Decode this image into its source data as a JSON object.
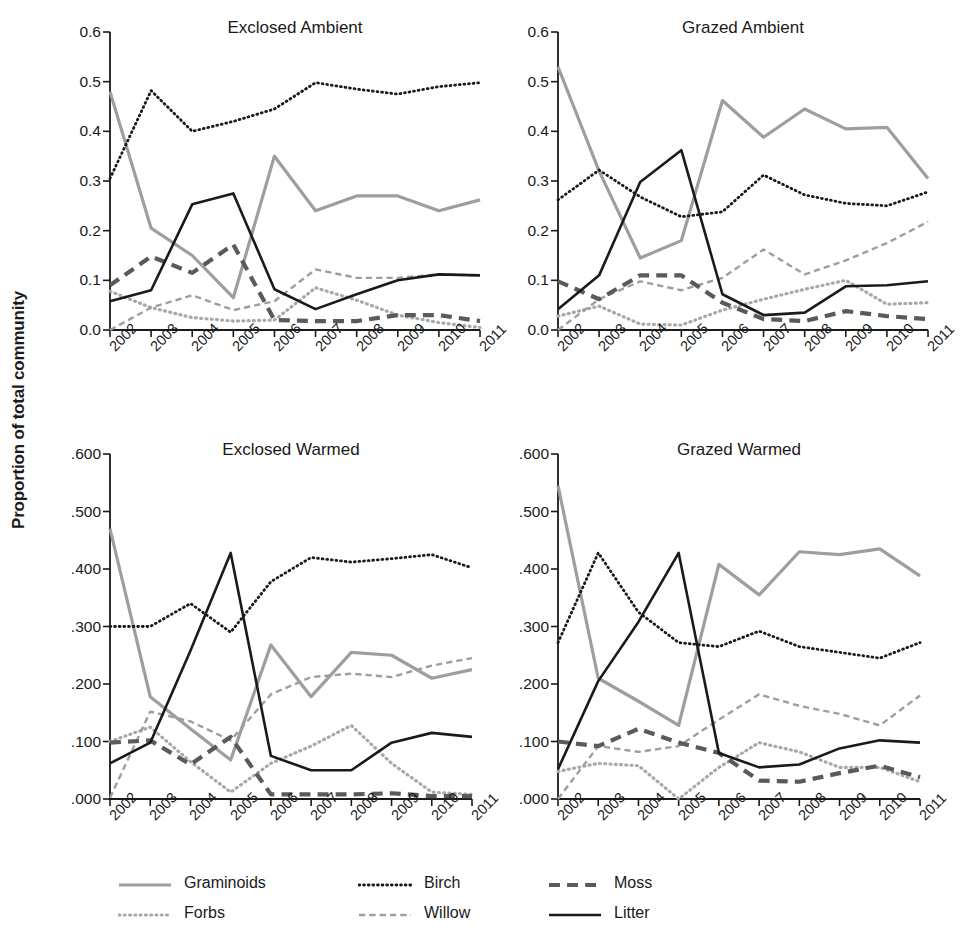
{
  "figure": {
    "ylabel": "Proportion of total community",
    "background": "#ffffff"
  },
  "series_styles": {
    "Graminoids": {
      "color": "#9e9e9e",
      "dash": "none",
      "width": 3.2
    },
    "Forbs": {
      "color": "#a8a8a8",
      "dash": "dotted",
      "width": 3.2
    },
    "Birch": {
      "color": "#1a1a1a",
      "dash": "dotted",
      "width": 2.8
    },
    "Willow": {
      "color": "#9e9e9e",
      "dash": "dashed",
      "width": 2.4
    },
    "Moss": {
      "color": "#5a5a5a",
      "dash": "dashed",
      "width": 4.2
    },
    "Litter": {
      "color": "#1a1a1a",
      "dash": "none",
      "width": 2.6
    }
  },
  "legend": {
    "items": [
      {
        "label": "Graminoids",
        "series": "Graminoids"
      },
      {
        "label": "Forbs",
        "series": "Forbs"
      },
      {
        "label": "Birch",
        "series": "Birch"
      },
      {
        "label": "Willow",
        "series": "Willow"
      },
      {
        "label": "Moss",
        "series": "Moss"
      },
      {
        "label": "Litter",
        "series": "Litter"
      }
    ]
  },
  "chart_data": [
    {
      "type": "line",
      "title": "Exclosed Ambient",
      "xlabel": "",
      "ylabel": "Proportion of total community",
      "x": [
        "2002",
        "2003",
        "2004",
        "2005",
        "2006",
        "2007",
        "2008",
        "2009",
        "2010",
        "2011"
      ],
      "ylim": [
        0.0,
        0.6
      ],
      "yticks": [
        0.0,
        0.1,
        0.2,
        0.3,
        0.4,
        0.5,
        0.6
      ],
      "ytick_labels": [
        "0.0",
        "0.1",
        "0.2",
        "0.3",
        "0.4",
        "0.5",
        "0.6"
      ],
      "grid": false,
      "legend_position": "below-figure",
      "series": [
        {
          "name": "Graminoids",
          "values": [
            0.48,
            0.205,
            0.15,
            0.065,
            0.35,
            0.24,
            0.27,
            0.27,
            0.24,
            0.262
          ]
        },
        {
          "name": "Forbs",
          "values": [
            0.078,
            0.045,
            0.025,
            0.018,
            0.02,
            0.085,
            0.06,
            0.03,
            0.015,
            0.005
          ]
        },
        {
          "name": "Birch",
          "values": [
            0.305,
            0.482,
            0.4,
            0.42,
            0.445,
            0.498,
            0.485,
            0.475,
            0.49,
            0.498
          ]
        },
        {
          "name": "Willow",
          "values": [
            0.0,
            0.045,
            0.07,
            0.04,
            0.058,
            0.122,
            0.105,
            0.105,
            0.112,
            0.11
          ]
        },
        {
          "name": "Moss",
          "values": [
            0.09,
            0.148,
            0.115,
            0.172,
            0.02,
            0.018,
            0.018,
            0.03,
            0.03,
            0.018
          ]
        },
        {
          "name": "Litter",
          "values": [
            0.058,
            0.08,
            0.253,
            0.275,
            0.082,
            0.042,
            0.072,
            0.1,
            0.112,
            0.11
          ]
        }
      ]
    },
    {
      "type": "line",
      "title": "Grazed Ambient",
      "xlabel": "",
      "ylabel": "Proportion of total community",
      "x": [
        "2002",
        "2003",
        "2004",
        "2005",
        "2006",
        "2007",
        "2008",
        "2009",
        "2010",
        "2011"
      ],
      "ylim": [
        0.0,
        0.6
      ],
      "yticks": [
        0.0,
        0.1,
        0.2,
        0.3,
        0.4,
        0.5,
        0.6
      ],
      "ytick_labels": [
        "0.0",
        "0.1",
        "0.2",
        "0.3",
        "0.4",
        "0.5",
        "0.6"
      ],
      "grid": false,
      "legend_position": "below-figure",
      "series": [
        {
          "name": "Graminoids",
          "values": [
            0.53,
            0.32,
            0.145,
            0.18,
            0.462,
            0.388,
            0.445,
            0.405,
            0.408,
            0.305
          ]
        },
        {
          "name": "Forbs",
          "values": [
            0.028,
            0.048,
            0.012,
            0.01,
            0.04,
            0.062,
            0.082,
            0.1,
            0.052,
            0.055
          ]
        },
        {
          "name": "Birch",
          "values": [
            0.262,
            0.322,
            0.268,
            0.228,
            0.238,
            0.312,
            0.272,
            0.255,
            0.25,
            0.278
          ]
        },
        {
          "name": "Willow",
          "values": [
            0.0,
            0.062,
            0.098,
            0.08,
            0.105,
            0.162,
            0.112,
            0.14,
            0.175,
            0.218
          ]
        },
        {
          "name": "Moss",
          "values": [
            0.098,
            0.062,
            0.11,
            0.11,
            0.055,
            0.022,
            0.018,
            0.038,
            0.028,
            0.022
          ]
        },
        {
          "name": "Litter",
          "values": [
            0.042,
            0.11,
            0.298,
            0.362,
            0.072,
            0.03,
            0.035,
            0.088,
            0.09,
            0.098
          ]
        }
      ]
    },
    {
      "type": "line",
      "title": "Exclosed Warmed",
      "xlabel": "",
      "ylabel": "Proportion of total community",
      "x": [
        "2002",
        "2003",
        "2004",
        "2005",
        "2006",
        "2007",
        "2008",
        "2009",
        "2010",
        "2011"
      ],
      "ylim": [
        0.0,
        0.6
      ],
      "yticks": [
        0.0,
        0.1,
        0.2,
        0.3,
        0.4,
        0.5,
        0.6
      ],
      "ytick_labels": [
        ".000",
        ".100",
        ".200",
        ".300",
        ".400",
        ".500",
        ".600"
      ],
      "grid": false,
      "legend_position": "below-figure",
      "series": [
        {
          "name": "Graminoids",
          "values": [
            0.47,
            0.178,
            0.122,
            0.068,
            0.268,
            0.178,
            0.255,
            0.25,
            0.21,
            0.225
          ]
        },
        {
          "name": "Forbs",
          "values": [
            0.1,
            0.125,
            0.065,
            0.012,
            0.062,
            0.092,
            0.128,
            0.062,
            0.012,
            0.008
          ]
        },
        {
          "name": "Birch",
          "values": [
            0.3,
            0.3,
            0.34,
            0.29,
            0.378,
            0.42,
            0.412,
            0.418,
            0.425,
            0.402
          ]
        },
        {
          "name": "Willow",
          "values": [
            0.002,
            0.152,
            0.135,
            0.102,
            0.182,
            0.212,
            0.218,
            0.212,
            0.232,
            0.245
          ]
        },
        {
          "name": "Moss",
          "values": [
            0.098,
            0.102,
            0.06,
            0.108,
            0.008,
            0.008,
            0.008,
            0.01,
            0.005,
            0.005
          ]
        },
        {
          "name": "Litter",
          "values": [
            0.062,
            0.098,
            0.258,
            0.428,
            0.075,
            0.05,
            0.05,
            0.098,
            0.115,
            0.108
          ]
        }
      ]
    },
    {
      "type": "line",
      "title": "Grazed Warmed",
      "xlabel": "",
      "ylabel": "Proportion of total community",
      "x": [
        "2002",
        "2003",
        "2004",
        "2005",
        "2006",
        "2007",
        "2008",
        "2009",
        "2010",
        "2011"
      ],
      "ylim": [
        0.0,
        0.6
      ],
      "yticks": [
        0.0,
        0.1,
        0.2,
        0.3,
        0.4,
        0.5,
        0.6
      ],
      "ytick_labels": [
        ".000",
        ".100",
        ".200",
        ".300",
        ".400",
        ".500",
        ".600"
      ],
      "grid": false,
      "legend_position": "below-figure",
      "series": [
        {
          "name": "Graminoids",
          "values": [
            0.545,
            0.21,
            0.17,
            0.128,
            0.408,
            0.355,
            0.43,
            0.425,
            0.435,
            0.388
          ]
        },
        {
          "name": "Forbs",
          "values": [
            0.048,
            0.062,
            0.058,
            0.0,
            0.055,
            0.098,
            0.082,
            0.055,
            0.055,
            0.03
          ]
        },
        {
          "name": "Birch",
          "values": [
            0.272,
            0.428,
            0.325,
            0.272,
            0.265,
            0.292,
            0.265,
            0.255,
            0.245,
            0.272
          ]
        },
        {
          "name": "Willow",
          "values": [
            0.0,
            0.092,
            0.082,
            0.092,
            0.138,
            0.182,
            0.162,
            0.148,
            0.128,
            0.18
          ]
        },
        {
          "name": "Moss",
          "values": [
            0.1,
            0.092,
            0.122,
            0.098,
            0.08,
            0.032,
            0.03,
            0.045,
            0.058,
            0.038
          ]
        },
        {
          "name": "Litter",
          "values": [
            0.052,
            0.205,
            0.308,
            0.428,
            0.08,
            0.055,
            0.06,
            0.088,
            0.102,
            0.098
          ]
        }
      ]
    }
  ]
}
